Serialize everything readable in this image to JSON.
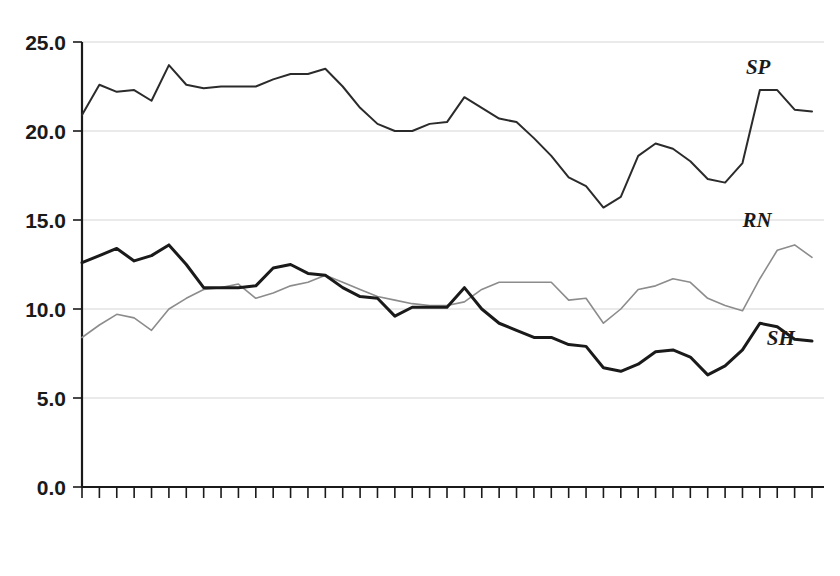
{
  "chart_data": {
    "type": "line",
    "title": "",
    "subtitle": "",
    "xlabel": "",
    "ylabel": "",
    "xlim": [
      1970,
      2012
    ],
    "ylim": [
      0.0,
      25.0
    ],
    "grid": true,
    "legend_position": "inline-right-end-labels",
    "y_ticks": [
      "0.0",
      "5.0",
      "10.0",
      "15.0",
      "20.0",
      "25.0"
    ],
    "y_tick_values": [
      0.0,
      5.0,
      10.0,
      15.0,
      20.0,
      25.0
    ],
    "x_ticks": [
      "1970",
      "1972",
      "1974",
      "1976",
      "1978",
      "1980",
      "1982",
      "1984",
      "1986",
      "1988",
      "1990",
      "1992",
      "1994",
      "1996",
      "1998",
      "2000",
      "2002",
      "2004",
      "2006",
      "2008",
      "2010",
      "2012"
    ],
    "x_tick_values": [
      1970,
      1972,
      1974,
      1976,
      1978,
      1980,
      1982,
      1984,
      1986,
      1988,
      1990,
      1992,
      1994,
      1996,
      1998,
      2000,
      2002,
      2004,
      2006,
      2008,
      2010,
      2012
    ],
    "x": [
      1970,
      1971,
      1972,
      1973,
      1974,
      1975,
      1976,
      1977,
      1978,
      1979,
      1980,
      1981,
      1982,
      1983,
      1984,
      1985,
      1986,
      1987,
      1988,
      1989,
      1990,
      1991,
      1992,
      1993,
      1994,
      1995,
      1996,
      1997,
      1998,
      1999,
      2000,
      2001,
      2002,
      2003,
      2004,
      2005,
      2006,
      2007,
      2008,
      2009,
      2010,
      2011,
      2012
    ],
    "series": [
      {
        "name": "SP",
        "label": "SP",
        "color": "#2b2b2b",
        "width": 2.0,
        "annotation": "SP",
        "values": [
          20.9,
          22.6,
          22.2,
          22.3,
          21.7,
          23.7,
          22.6,
          22.4,
          22.5,
          22.5,
          22.5,
          22.9,
          23.2,
          23.2,
          23.5,
          22.5,
          21.3,
          20.4,
          20.0,
          20.0,
          20.4,
          20.5,
          21.9,
          21.3,
          20.7,
          20.5,
          19.6,
          18.6,
          17.4,
          16.9,
          15.7,
          16.3,
          18.6,
          19.3,
          19.0,
          18.3,
          17.3,
          17.1,
          18.2,
          22.3,
          22.3,
          21.2,
          21.1
        ]
      },
      {
        "name": "RN",
        "label": "RN",
        "color": "#8c8c8c",
        "width": 1.6,
        "annotation": "RN",
        "values": [
          8.4,
          9.1,
          9.7,
          9.5,
          8.8,
          10.0,
          10.6,
          11.1,
          11.2,
          11.4,
          10.6,
          10.9,
          11.3,
          11.5,
          11.9,
          11.5,
          11.1,
          10.7,
          10.5,
          10.3,
          10.2,
          10.2,
          10.4,
          11.1,
          11.5,
          11.5,
          11.5,
          11.5,
          10.5,
          10.6,
          9.2,
          10.0,
          11.1,
          11.3,
          11.7,
          11.5,
          10.6,
          10.2,
          9.9,
          11.7,
          13.3,
          13.6,
          12.9
        ]
      },
      {
        "name": "SH",
        "label": "SH",
        "color": "#1a1a1a",
        "width": 3.0,
        "annotation": "SH",
        "values": [
          12.6,
          13.0,
          13.4,
          12.7,
          13.0,
          13.6,
          12.5,
          11.2,
          11.2,
          11.2,
          11.3,
          12.3,
          12.5,
          12.0,
          11.9,
          11.2,
          10.7,
          10.6,
          9.6,
          10.1,
          10.1,
          10.1,
          11.2,
          10.0,
          9.2,
          8.8,
          8.4,
          8.4,
          8.0,
          7.9,
          6.7,
          6.5,
          6.9,
          7.6,
          7.7,
          7.3,
          6.3,
          6.8,
          7.7,
          9.2,
          9.0,
          8.3,
          8.2
        ]
      }
    ]
  }
}
